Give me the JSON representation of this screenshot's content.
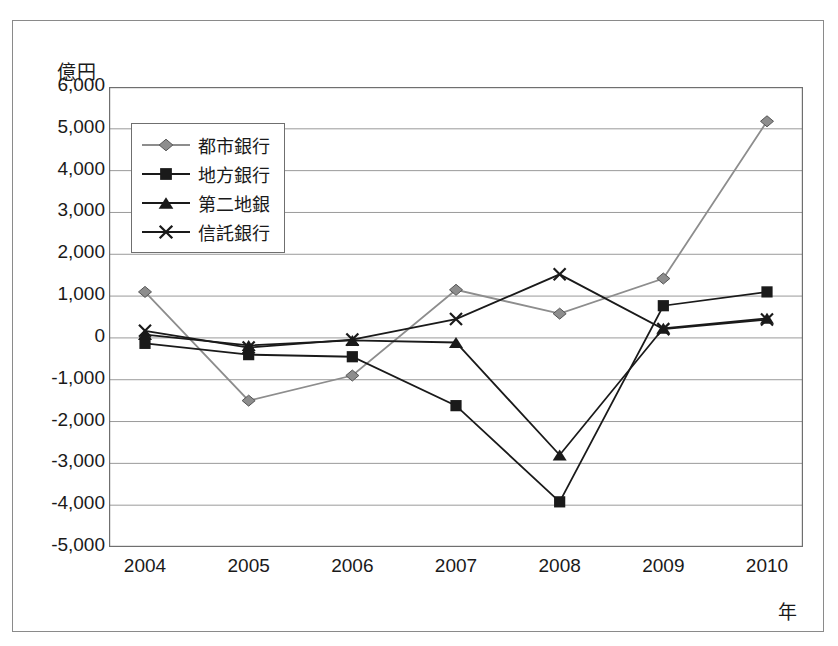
{
  "figure": {
    "unit_label": "億円",
    "x_axis_name": "年"
  },
  "legend": {
    "position": "top-left-inside",
    "items": [
      {
        "label": "都市銀行",
        "marker": "diamond-marker-icon",
        "color": "#8d8d8d"
      },
      {
        "label": "地方銀行",
        "marker": "square-marker-icon",
        "color": "#1a1a1a"
      },
      {
        "label": "第二地銀",
        "marker": "triangle-marker-icon",
        "color": "#1a1a1a"
      },
      {
        "label": "信託銀行",
        "marker": "x-marker-icon",
        "color": "#1a1a1a"
      }
    ]
  },
  "chart_data": {
    "type": "line",
    "title": "",
    "xlabel": "年",
    "ylabel": "億円",
    "categories": [
      "2004",
      "2005",
      "2006",
      "2007",
      "2008",
      "2009",
      "2010"
    ],
    "x": [
      2004,
      2005,
      2006,
      2007,
      2008,
      2009,
      2010
    ],
    "ylim": [
      -5000,
      6000
    ],
    "ytick_labels": [
      "6,000",
      "5,000",
      "4,000",
      "3,000",
      "2,000",
      "1,000",
      "0",
      "-1,000",
      "-2,000",
      "-3,000",
      "-4,000",
      "-5,000"
    ],
    "ytick_values": [
      6000,
      5000,
      4000,
      3000,
      2000,
      1000,
      0,
      -1000,
      -2000,
      -3000,
      -4000,
      -5000
    ],
    "grid": "horizontal",
    "legend_position": "upper left",
    "series": [
      {
        "name": "都市銀行",
        "marker": "diamond",
        "color": "#8d8d8d",
        "values": [
          1100,
          -1500,
          -900,
          1150,
          580,
          1420,
          5180
        ]
      },
      {
        "name": "地方銀行",
        "marker": "square",
        "color": "#1a1a1a",
        "values": [
          -130,
          -400,
          -450,
          -1620,
          -3920,
          770,
          1100
        ]
      },
      {
        "name": "第二地銀",
        "marker": "triangle",
        "color": "#1a1a1a",
        "values": [
          80,
          -180,
          -60,
          -110,
          -2800,
          230,
          470
        ]
      },
      {
        "name": "信託銀行",
        "marker": "x",
        "color": "#1a1a1a",
        "values": [
          170,
          -230,
          -40,
          450,
          1520,
          210,
          440
        ]
      }
    ]
  }
}
